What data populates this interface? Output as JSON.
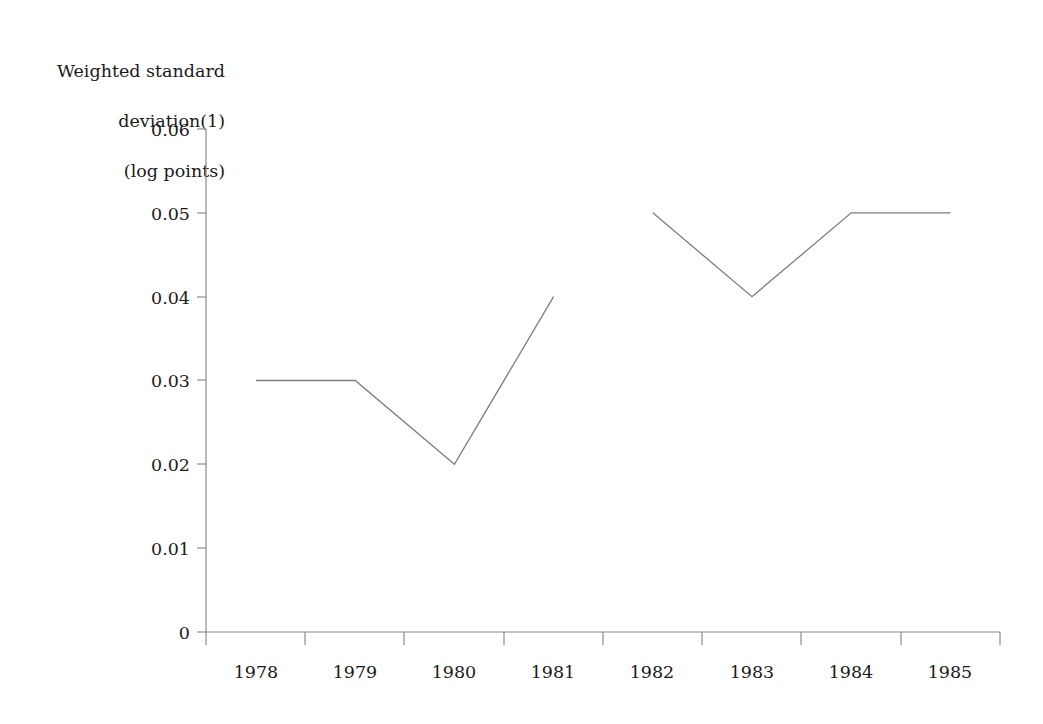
{
  "chart_data": {
    "type": "line",
    "title": "",
    "ylabel": "Weighted standard\ndeviation(1)\n(log points)",
    "ylabel_lines": [
      "Weighted standard",
      "deviation(1)",
      "(log points)"
    ],
    "xlabel": "",
    "categories": [
      "1978",
      "1979",
      "1980",
      "1981",
      "1982",
      "1983",
      "1984",
      "1985"
    ],
    "x": [
      1978,
      1979,
      1980,
      1981,
      1982,
      1983,
      1984,
      1985
    ],
    "series": [
      {
        "name": "segment-1",
        "x": [
          1978,
          1979,
          1980,
          1981
        ],
        "values": [
          0.03,
          0.03,
          0.02,
          0.04
        ]
      },
      {
        "name": "segment-2",
        "x": [
          1982,
          1983,
          1984,
          1985
        ],
        "values": [
          0.05,
          0.04,
          0.05,
          0.05
        ]
      }
    ],
    "values": [
      0.03,
      0.03,
      0.02,
      0.04,
      0.05,
      0.04,
      0.05,
      0.05
    ],
    "ylim": [
      0,
      0.06
    ],
    "yticks": [
      0,
      0.01,
      0.02,
      0.03,
      0.04,
      0.05,
      0.06
    ],
    "ytick_labels": [
      "0",
      "0.01",
      "0.02",
      "0.03",
      "0.04",
      "0.05",
      "0.06"
    ],
    "xlim": [
      1977.5,
      1985.5
    ],
    "grid": false,
    "legend": null,
    "line_color": "#7d7d7d",
    "axis_color": "#8a8a8a",
    "background_color": "#ffffff",
    "annotations": [],
    "note": "Line is broken between 1981 and 1982"
  }
}
